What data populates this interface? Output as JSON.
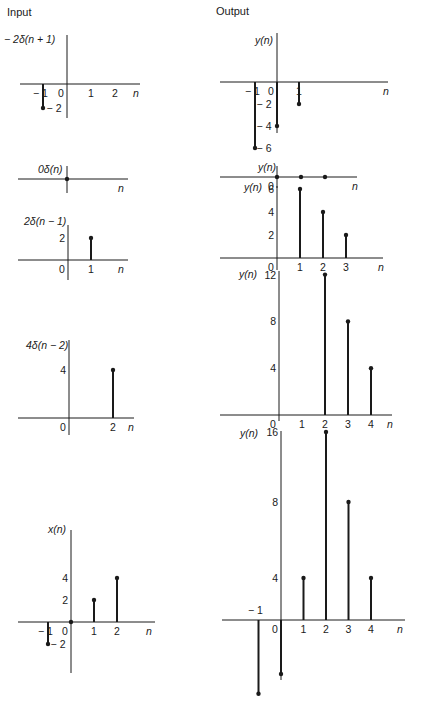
{
  "columns": {
    "input_title": "Input",
    "output_title": "Output"
  },
  "panels": [
    {
      "id": "in-1",
      "column": "input",
      "ylabel": "− 2δ(n + 1)",
      "origin": [
        67,
        84
      ],
      "xscale": 24,
      "yscale": 12,
      "xaxis": [
        20,
        140
      ],
      "yaxis": [
        35,
        118
      ],
      "xticks": [
        {
          "v": -1,
          "t": "− 1"
        },
        {
          "v": 0,
          "t": "0"
        },
        {
          "v": 1,
          "t": "1"
        },
        {
          "v": 2,
          "t": "2"
        }
      ],
      "yticks": [
        {
          "v": -2,
          "t": "− 2"
        }
      ],
      "n_label_x": 133,
      "stems": [
        {
          "n": -1,
          "v": -2
        }
      ],
      "ylabel_pos": [
        4,
        43
      ]
    },
    {
      "id": "in-2",
      "column": "input",
      "ylabel": "0δ(n)",
      "origin": [
        67,
        179
      ],
      "xscale": 24,
      "yscale": 12,
      "xaxis": [
        18,
        128
      ],
      "yaxis": [
        166,
        193
      ],
      "xticks": [],
      "yticks": [],
      "n_label_x": 118,
      "stems": [
        {
          "n": 0,
          "v": 0
        }
      ],
      "ylabel_pos": [
        38,
        173
      ]
    },
    {
      "id": "in-3",
      "column": "input",
      "ylabel": "2δ(n − 1)",
      "origin": [
        68,
        260
      ],
      "xscale": 23,
      "yscale": 11,
      "xaxis": [
        18,
        128
      ],
      "yaxis": [
        225,
        280
      ],
      "xticks": [
        {
          "v": 0,
          "t": "0"
        },
        {
          "v": 1,
          "t": "1"
        }
      ],
      "yticks": [
        {
          "v": 2,
          "t": "2"
        }
      ],
      "n_label_x": 118,
      "stems": [
        {
          "n": 1,
          "v": 2
        }
      ],
      "ylabel_pos": [
        24,
        225
      ]
    },
    {
      "id": "in-4",
      "column": "input",
      "ylabel": "4δ(n − 2)",
      "origin": [
        69,
        418
      ],
      "xscale": 22,
      "yscale": 12,
      "xaxis": [
        18,
        134
      ],
      "yaxis": [
        340,
        435
      ],
      "xticks": [
        {
          "v": 0,
          "t": "0"
        },
        {
          "v": 2,
          "t": "2"
        }
      ],
      "yticks": [
        {
          "v": 4,
          "t": "4"
        }
      ],
      "n_label_x": 128,
      "stems": [
        {
          "n": 2,
          "v": 4
        }
      ],
      "ylabel_pos": [
        26,
        349
      ]
    },
    {
      "id": "in-5",
      "column": "input",
      "ylabel": "x(n)",
      "origin": [
        71,
        622
      ],
      "xscale": 23,
      "yscale": 11,
      "xaxis": [
        18,
        155
      ],
      "yaxis": [
        530,
        673
      ],
      "xticks": [
        {
          "v": -1,
          "t": "− 1"
        },
        {
          "v": 0,
          "t": "0"
        },
        {
          "v": 1,
          "t": "1"
        },
        {
          "v": 2,
          "t": "2"
        }
      ],
      "yticks": [
        {
          "v": 4,
          "t": "4"
        },
        {
          "v": 2,
          "t": "2"
        },
        {
          "v": -2,
          "t": "− 2"
        }
      ],
      "n_label_x": 146,
      "stems": [
        {
          "n": -1,
          "v": -2
        },
        {
          "n": 0,
          "v": 0
        },
        {
          "n": 1,
          "v": 2
        },
        {
          "n": 2,
          "v": 4
        }
      ],
      "ylabel_pos": [
        48,
        533
      ]
    },
    {
      "id": "out-1",
      "column": "output",
      "ylabel": "y(n)",
      "origin": [
        277,
        82
      ],
      "xscale": 22,
      "yscale": 11,
      "xaxis": [
        220,
        388
      ],
      "yaxis": [
        33,
        133
      ],
      "xticks": [
        {
          "v": -1,
          "t": "− 1"
        },
        {
          "v": 0,
          "t": "0"
        },
        {
          "v": 1,
          "t": "1"
        }
      ],
      "yticks": [
        {
          "v": -2,
          "t": "− 2"
        },
        {
          "v": -4,
          "t": "− 4"
        },
        {
          "v": -6,
          "t": "− 6"
        }
      ],
      "n_label_x": 383,
      "stems": [
        {
          "n": -1,
          "v": -6
        },
        {
          "n": 0,
          "v": -4
        },
        {
          "n": 1,
          "v": -2
        }
      ],
      "ylabel_pos": [
        255,
        44
      ]
    },
    {
      "id": "out-2",
      "column": "output",
      "ylabel": "y(n)",
      "origin": [
        277,
        177
      ],
      "xscale": 24,
      "yscale": 11,
      "xaxis": [
        220,
        357
      ],
      "yaxis": [
        166,
        188
      ],
      "xticks": [
        {
          "v": 0,
          "t": "0"
        }
      ],
      "yticks": [],
      "n_label_x": 352,
      "stems": [
        {
          "n": 0,
          "v": 0
        },
        {
          "n": 1,
          "v": 0
        },
        {
          "n": 2,
          "v": 0
        }
      ],
      "ylabel_pos": [
        258,
        171
      ]
    },
    {
      "id": "out-3",
      "column": "output",
      "ylabel": "y(n)",
      "origin": [
        277,
        258
      ],
      "xscale": 23,
      "yscale": 11.5,
      "xaxis": [
        220,
        383
      ],
      "yaxis": [
        186,
        270
      ],
      "xticks": [
        {
          "v": 0,
          "t": "0"
        },
        {
          "v": 1,
          "t": "1"
        },
        {
          "v": 2,
          "t": "2"
        },
        {
          "v": 3,
          "t": "3"
        }
      ],
      "yticks": [
        {
          "v": 6,
          "t": "6"
        },
        {
          "v": 4,
          "t": "4"
        },
        {
          "v": 2,
          "t": "2"
        }
      ],
      "n_label_x": 378,
      "stems": [
        {
          "n": 1,
          "v": 6
        },
        {
          "n": 2,
          "v": 4
        },
        {
          "n": 3,
          "v": 2
        }
      ],
      "ylabel_pos": [
        244,
        191
      ]
    },
    {
      "id": "out-4",
      "column": "output",
      "ylabel": "y(n)",
      "origin": [
        279,
        415
      ],
      "xscale": 23,
      "yscale": 11.7,
      "xaxis": [
        220,
        392
      ],
      "yaxis": [
        271,
        421
      ],
      "xticks": [
        {
          "v": 0,
          "t": "0"
        },
        {
          "v": 1,
          "t": "1"
        },
        {
          "v": 2,
          "t": "2"
        },
        {
          "v": 3,
          "t": "3"
        },
        {
          "v": 4,
          "t": "4"
        }
      ],
      "yticks": [
        {
          "v": 12,
          "t": "12"
        },
        {
          "v": 8,
          "t": "8"
        },
        {
          "v": 4,
          "t": "4"
        }
      ],
      "n_label_x": 387,
      "stems": [
        {
          "n": 2,
          "v": 12
        },
        {
          "n": 3,
          "v": 8
        },
        {
          "n": 4,
          "v": 4
        }
      ],
      "ylabel_pos": [
        239,
        278
      ]
    },
    {
      "id": "out-5",
      "column": "output",
      "ylabel": "y(n)",
      "origin": [
        281,
        620
      ],
      "xscale": 22.5,
      "yscale": 11.3,
      "xaxis": [
        222,
        405
      ],
      "yaxis": [
        431,
        680
      ],
      "xticks": [
        {
          "v": 0,
          "t": "0"
        },
        {
          "v": 1,
          "t": "1"
        },
        {
          "v": 2,
          "t": "2"
        },
        {
          "v": 3,
          "t": "3"
        },
        {
          "v": 4,
          "t": "4"
        }
      ],
      "yticks": [
        {
          "v": 16,
          "t": "16"
        },
        {
          "v": 8,
          "t": "8"
        },
        {
          "v": 4,
          "t": "4"
        }
      ],
      "extra_labels": [
        {
          "t": "− 1",
          "x": 248,
          "y": 614
        }
      ],
      "n_label_x": 397,
      "stems": [
        {
          "n": -1,
          "v": -6
        },
        {
          "n": 0,
          "v": -4
        },
        {
          "n": 1,
          "v": 4
        },
        {
          "n": 2,
          "v": 16
        },
        {
          "n": 3,
          "v": 8
        },
        {
          "n": 4,
          "v": 4
        }
      ],
      "ylabel_pos": [
        240,
        437
      ],
      "ytick_scale_note": "y-axis 16/8/4 unevenly spaced as printed"
    }
  ],
  "style": {
    "ink": "#1a1a1a",
    "background": "#ffffff"
  }
}
